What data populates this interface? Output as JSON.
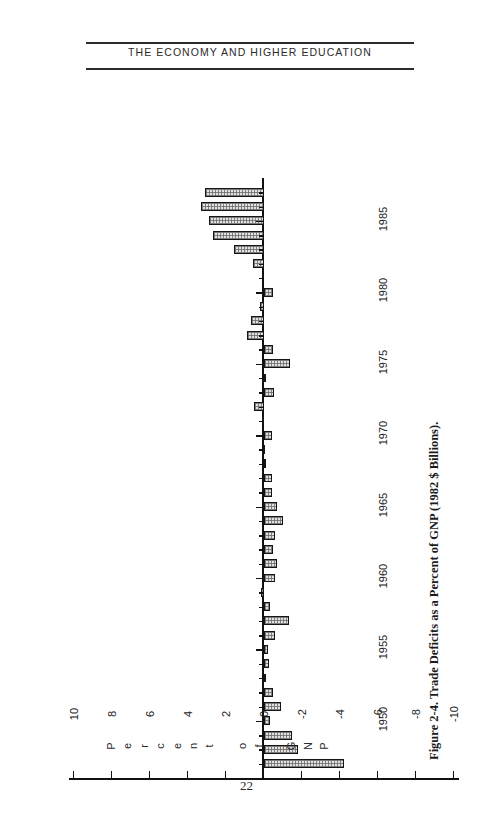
{
  "page": {
    "running_head": "THE ECONOMY AND HIGHER EDUCATION",
    "folio": "22",
    "caption": "Figure 2-4. Trade Deficits as a Percent of GNP (1982 $ Billions)."
  },
  "chart_data": {
    "type": "bar",
    "orientation": "horizontal-rotated",
    "title": "Figure 2-4. Trade Deficits as a Percent of GNP (1982 $ Billions).",
    "xlabel": "",
    "ylabel": "Percent of GNP",
    "ylim": [
      -10,
      10
    ],
    "grid": false,
    "legend": null,
    "axis_title_letters": [
      "P",
      "e",
      "r",
      "c",
      "e",
      "n",
      "t",
      "",
      "o",
      "f",
      "",
      "G",
      "N",
      "P"
    ],
    "value_ticks": [
      10,
      8,
      6,
      4,
      2,
      0,
      -2,
      -4,
      -6,
      -8,
      -10
    ],
    "value_tick_labels": [
      "10",
      "8",
      "6",
      "4",
      "2",
      "0",
      "-2",
      "-4",
      "-6",
      "-8",
      "-10"
    ],
    "year_tick_labels": [
      "1950",
      "1955",
      "1960",
      "1965",
      "1970",
      "1975",
      "1980",
      "1985"
    ],
    "categories": [
      1947,
      1948,
      1949,
      1950,
      1951,
      1952,
      1953,
      1954,
      1955,
      1956,
      1957,
      1958,
      1959,
      1960,
      1961,
      1962,
      1963,
      1964,
      1965,
      1966,
      1967,
      1968,
      1969,
      1970,
      1971,
      1972,
      1973,
      1974,
      1975,
      1976,
      1977,
      1978,
      1979,
      1980,
      1981,
      1982,
      1983,
      1984,
      1985,
      1986,
      1987
    ],
    "values": [
      4.2,
      1.8,
      1.5,
      0.3,
      0.9,
      0.5,
      0.1,
      0.25,
      0.2,
      0.6,
      1.3,
      0.3,
      -0.15,
      0.6,
      0.7,
      0.5,
      0.6,
      1.0,
      0.7,
      0.4,
      0.4,
      0.1,
      0.05,
      0.4,
      -0.1,
      -0.5,
      0.55,
      0.1,
      1.35,
      0.45,
      -0.9,
      -0.7,
      -0.2,
      0.5,
      -0.1,
      -0.6,
      -1.6,
      -2.7,
      -2.9,
      -3.3,
      -3.1
    ]
  }
}
